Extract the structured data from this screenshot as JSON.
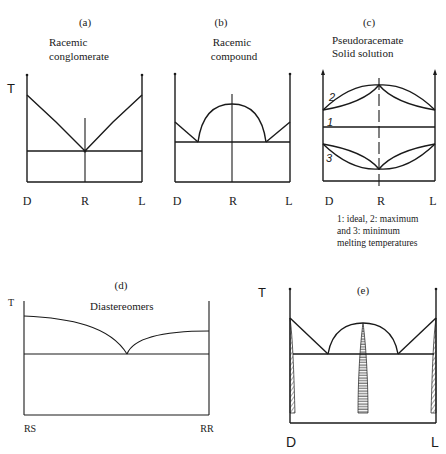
{
  "figure": {
    "panels": [
      {
        "id": "a",
        "label": "(a)",
        "title_line1": "Racemic",
        "title_line2": "conglomerate",
        "y_axis": "T",
        "x_ticks": [
          "D",
          "R",
          "L"
        ]
      },
      {
        "id": "b",
        "label": "(b)",
        "title_line1": "Racemic",
        "title_line2": "compound",
        "x_ticks": [
          "D",
          "R",
          "L"
        ]
      },
      {
        "id": "c",
        "label": "(c)",
        "title_line1": "Pseudoracemate",
        "title_line2": "Solid solution",
        "x_ticks": [
          "D",
          "R",
          "L"
        ],
        "curve_labels": [
          "2",
          "1",
          "3"
        ],
        "caption_line1": "1: ideal, 2: maximum",
        "caption_line2": "and 3: minimum",
        "caption_line3": "melting temperatures"
      },
      {
        "id": "d",
        "label": "(d)",
        "title": "Diastereomers",
        "y_axis": "T",
        "x_ticks": [
          "RS",
          "RR"
        ]
      },
      {
        "id": "e",
        "label": "(e)",
        "y_axis": "T",
        "x_ticks": [
          "D",
          "L"
        ]
      }
    ]
  }
}
